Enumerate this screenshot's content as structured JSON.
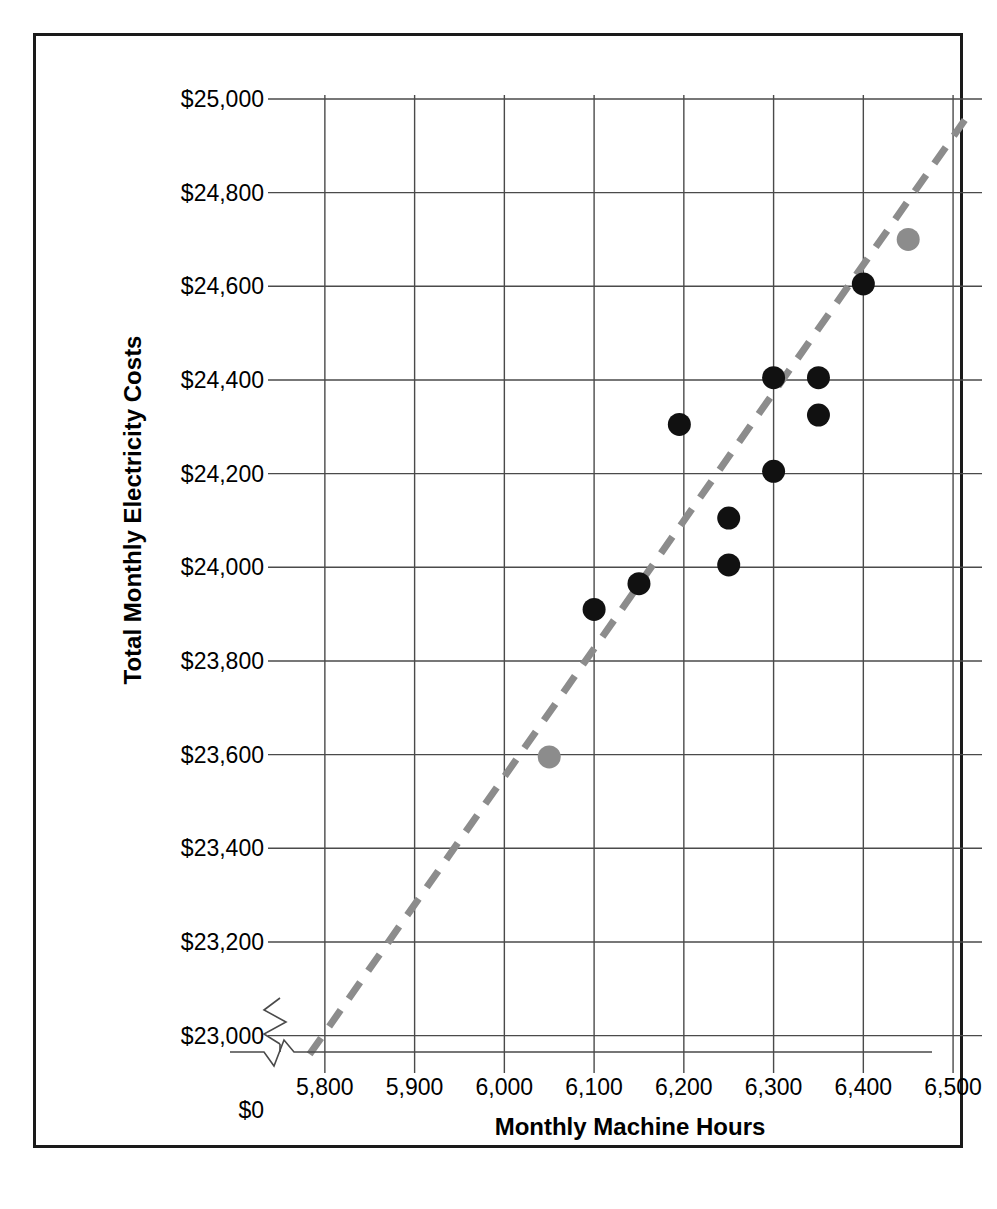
{
  "chart_data": {
    "type": "scatter",
    "title": "",
    "xlabel": "Monthly Machine Hours",
    "ylabel": "Total Monthly Electricity Costs",
    "xlim": [
      5750,
      6530
    ],
    "ylim": [
      22950,
      25000
    ],
    "grid": true,
    "legend": "none",
    "axis_break": true,
    "axis_break_note": "y-axis broken between $0 and $23,000",
    "xticks": [
      5800,
      5900,
      6000,
      6100,
      6200,
      6300,
      6400,
      6500
    ],
    "xtick_labels": [
      "5,800",
      "5,900",
      "6,000",
      "6,100",
      "6,200",
      "6,300",
      "6,400",
      "6,500"
    ],
    "yticks": [
      23000,
      23200,
      23400,
      23600,
      23800,
      24000,
      24200,
      24400,
      24600,
      24800,
      25000
    ],
    "ytick_labels": [
      "$23,000",
      "$23,200",
      "$23,400",
      "$23,600",
      "$23,800",
      "$24,000",
      "$24,200",
      "$24,400",
      "$24,600",
      "$24,800",
      "$25,000"
    ],
    "y_origin_label": "$0",
    "series": [
      {
        "name": "observations",
        "color": "#111111",
        "marker": "circle",
        "points": [
          {
            "x": 6100,
            "y": 23910
          },
          {
            "x": 6150,
            "y": 23965
          },
          {
            "x": 6195,
            "y": 24305
          },
          {
            "x": 6250,
            "y": 24105
          },
          {
            "x": 6250,
            "y": 24005
          },
          {
            "x": 6300,
            "y": 24405
          },
          {
            "x": 6300,
            "y": 24205
          },
          {
            "x": 6350,
            "y": 24405
          },
          {
            "x": 6350,
            "y": 24325
          },
          {
            "x": 6400,
            "y": 24605
          }
        ]
      },
      {
        "name": "high-low-points",
        "color": "#8c8c8c",
        "marker": "circle",
        "points": [
          {
            "x": 6050,
            "y": 23595
          },
          {
            "x": 6450,
            "y": 24700
          }
        ]
      }
    ],
    "trendline": {
      "name": "high-low cost line",
      "style": "dashed",
      "color": "#8c8c8c",
      "x_start": 5783,
      "y_start": 22960,
      "x_end": 6513,
      "y_end": 24955
    }
  },
  "axis": {
    "y_label": "Total Monthly Electricity Costs",
    "x_label": "Monthly Machine Hours",
    "y_zero_label": "$0"
  }
}
